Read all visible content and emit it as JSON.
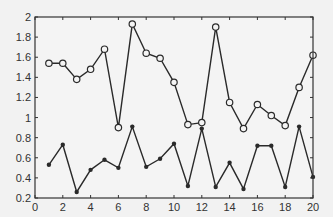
{
  "chart_data": {
    "type": "line",
    "title": "",
    "xlabel": "",
    "ylabel": "",
    "xlim": [
      0,
      20
    ],
    "ylim": [
      0.2,
      2
    ],
    "grid": false,
    "legend": null,
    "x_ticks": [
      "0",
      "2",
      "4",
      "6",
      "8",
      "10",
      "12",
      "14",
      "16",
      "18",
      "20"
    ],
    "y_ticks": [
      "0.2",
      "0.4",
      "0.6",
      "0.8",
      "1",
      "1.2",
      "1.4",
      "1.6",
      "1.8",
      "2"
    ],
    "x": [
      1,
      2,
      3,
      4,
      5,
      6,
      7,
      8,
      9,
      10,
      11,
      12,
      13,
      14,
      15,
      16,
      17,
      18,
      19,
      20
    ],
    "series": [
      {
        "name": "series-1",
        "marker": "open-circle",
        "values": [
          1.54,
          1.54,
          1.38,
          1.48,
          1.68,
          0.9,
          1.93,
          1.64,
          1.59,
          1.35,
          0.93,
          0.95,
          1.9,
          1.15,
          0.89,
          1.13,
          1.02,
          0.92,
          1.3,
          1.62
        ]
      },
      {
        "name": "series-2",
        "marker": "filled-dot",
        "values": [
          0.53,
          0.73,
          0.26,
          0.48,
          0.58,
          0.5,
          0.91,
          0.51,
          0.59,
          0.74,
          0.32,
          0.89,
          0.31,
          0.55,
          0.29,
          0.72,
          0.72,
          0.31,
          0.91,
          0.41
        ]
      }
    ]
  },
  "colors": {
    "background": "#f2f2f2",
    "line": "#2a2a2a",
    "axis": "#333333"
  }
}
